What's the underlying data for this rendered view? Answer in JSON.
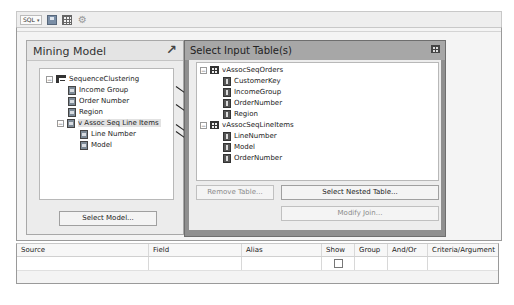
{
  "toolbar": {
    "view_selector": "SQL",
    "view_selector_caret": "▾",
    "icons": [
      "save-icon",
      "grid-icon",
      "gear-icon"
    ]
  },
  "mining_model": {
    "title": "Mining Model",
    "header_icon": "↗",
    "tree": {
      "root": "SequenceClustering",
      "children": [
        {
          "label": "Income Group",
          "icon": "input-column-icon"
        },
        {
          "label": "Order Number",
          "icon": "key-column-icon"
        },
        {
          "label": "Region",
          "icon": "input-column-icon"
        },
        {
          "label": "v Assoc Seq Line Items",
          "icon": "nested-table-icon",
          "selected": true,
          "children": [
            {
              "label": "Line Number",
              "icon": "key-column-icon"
            },
            {
              "label": "Model",
              "icon": "predict-column-icon"
            }
          ]
        }
      ]
    },
    "select_model_button": "Select Model..."
  },
  "input_tables": {
    "title": "Select Input Table(s)",
    "tables": [
      {
        "name": "vAssocSeqOrders",
        "columns": [
          "CustomerKey",
          "IncomeGroup",
          "OrderNumber",
          "Region"
        ]
      },
      {
        "name": "vAssocSeqLineItems",
        "columns": [
          "LineNumber",
          "Model",
          "OrderNumber"
        ]
      }
    ],
    "remove_table_button": "Remove Table...",
    "select_nested_button": "Select Nested Table...",
    "modify_join_button": "Modify Join..."
  },
  "grid": {
    "columns": [
      "Source",
      "Field",
      "Alias",
      "Show",
      "Group",
      "And/Or",
      "Criteria/Argument"
    ],
    "rows": [
      {
        "source": "",
        "field": "",
        "alias": "",
        "show": false,
        "group": "",
        "and_or": "",
        "criteria": ""
      }
    ]
  },
  "expander_collapse": "−"
}
